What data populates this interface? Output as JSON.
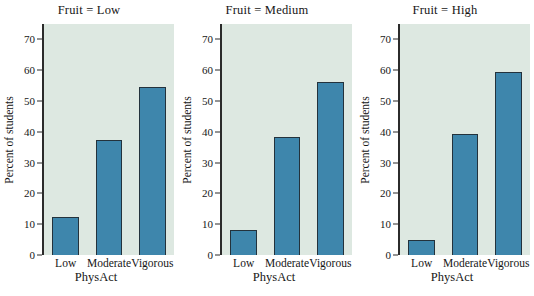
{
  "chart_data": {
    "type": "bar",
    "title": "",
    "xlabel": "PhysAct",
    "ylabel": "Percent of students",
    "ylim": [
      0,
      75
    ],
    "yticks": [
      0,
      10,
      20,
      30,
      40,
      50,
      60,
      70
    ],
    "ytick_labels": [
      "0",
      "10",
      "20",
      "30",
      "40",
      "50",
      "60",
      "70"
    ],
    "categories": [
      "Low",
      "Moderate",
      "Vigorous"
    ],
    "grid": false,
    "legend": "none",
    "facet_variable": "Fruit",
    "panels": [
      {
        "strip_label": "Fruit = Low",
        "facet_value": "Low",
        "values": [
          12.2,
          37.4,
          54.4
        ]
      },
      {
        "strip_label": "Fruit = Medium",
        "facet_value": "Medium",
        "values": [
          8.1,
          38.4,
          56.1
        ]
      },
      {
        "strip_label": "Fruit = High",
        "facet_value": "High",
        "values": [
          5.0,
          39.3,
          59.4
        ]
      }
    ],
    "colors": {
      "bar_fill": "#3e86ac",
      "bar_edge": "#23323c",
      "panel_background": "#dde8e1",
      "figure_background": "#ffffff",
      "axis": "#2b2b2b",
      "text": "#161616"
    }
  }
}
